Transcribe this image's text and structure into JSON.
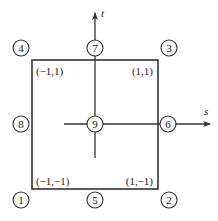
{
  "diagram": {
    "title": "",
    "axes": {
      "s_label": "s",
      "t_label": "t"
    },
    "corner_coords": {
      "top_left": "(−1,1)",
      "top_right": "(1,1)",
      "bottom_left": "(−1,−1)",
      "bottom_right": "(1,−1)"
    },
    "nodes": {
      "n1": "1",
      "n2": "2",
      "n3": "3",
      "n4": "4",
      "n5": "5",
      "n6": "6",
      "n7": "7",
      "n8": "8",
      "n9": "9"
    },
    "colors": {
      "stroke": "#333333",
      "text": "#222222",
      "background": "#ffffff"
    }
  }
}
